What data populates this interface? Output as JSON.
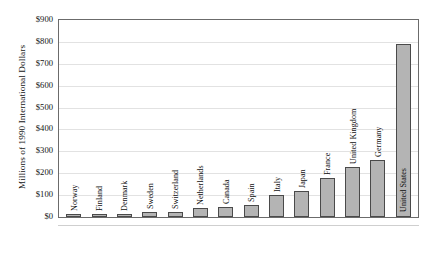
{
  "chart_data": {
    "type": "bar",
    "title": "",
    "subtitle": "",
    "xlabel": "",
    "ylabel": "Millions of 1990 International Dollars",
    "ylim": [
      0,
      900
    ],
    "ytick_step": 100,
    "ytick_labels": [
      "$900",
      "$800",
      "$700",
      "$600",
      "$500",
      "$400",
      "$300",
      "$200",
      "$100",
      "$0"
    ],
    "ytick_values": [
      900,
      800,
      700,
      600,
      500,
      400,
      300,
      200,
      100,
      0
    ],
    "grid": true,
    "grid_axis": "y",
    "legend": false,
    "legend_position": "none",
    "bar_color": "#b4b4b4",
    "bar_edge_color": "#4a4a4a",
    "axis_color": "#6b6b6b",
    "gridline_color": "#e2e2e2",
    "categories": [
      "Norway",
      "Finland",
      "Denmark",
      "Sweden",
      "Switzerland",
      "Netherlands",
      "Canada",
      "Spain",
      "Italy",
      "Japan",
      "France",
      "United Kingdom",
      "Germany",
      "United States"
    ],
    "values": [
      7,
      8,
      14,
      22,
      25,
      40,
      48,
      55,
      100,
      120,
      180,
      230,
      260,
      790
    ],
    "bars": [
      {
        "label": "Norway",
        "value": 7,
        "label_position": "outside"
      },
      {
        "label": "Finland",
        "value": 8,
        "label_position": "outside"
      },
      {
        "label": "Denmark",
        "value": 14,
        "label_position": "outside"
      },
      {
        "label": "Sweden",
        "value": 22,
        "label_position": "outside"
      },
      {
        "label": "Switzerland",
        "value": 25,
        "label_position": "outside"
      },
      {
        "label": "Netherlands",
        "value": 40,
        "label_position": "outside"
      },
      {
        "label": "Canada",
        "value": 48,
        "label_position": "outside"
      },
      {
        "label": "Spain",
        "value": 55,
        "label_position": "outside"
      },
      {
        "label": "Italy",
        "value": 100,
        "label_position": "outside"
      },
      {
        "label": "Japan",
        "value": 120,
        "label_position": "outside"
      },
      {
        "label": "France",
        "value": 180,
        "label_position": "outside"
      },
      {
        "label": "United Kingdom",
        "value": 230,
        "label_position": "outside"
      },
      {
        "label": "Germany",
        "value": 260,
        "label_position": "outside"
      },
      {
        "label": "United States",
        "value": 790,
        "label_position": "inside"
      }
    ]
  }
}
